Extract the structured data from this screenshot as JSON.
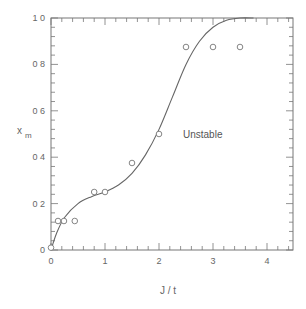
{
  "chart_data": {
    "type": "scatter",
    "title": "",
    "xlabel": "J / t",
    "ylabel": "x_m",
    "ylabel_main": "x",
    "ylabel_sub": "m",
    "xlim": [
      0,
      4.5
    ],
    "ylim": [
      0,
      1.0
    ],
    "x_ticks": [
      0,
      1,
      2,
      3,
      4
    ],
    "x_tick_labels": [
      "0",
      "1",
      "2",
      "3",
      "4"
    ],
    "y_ticks": [
      0,
      0.2,
      0.4,
      0.6,
      0.8,
      1.0
    ],
    "y_tick_labels": [
      "0",
      "0 2",
      "0 4",
      "0 6",
      "0 8",
      "1 0"
    ],
    "grid": false,
    "legend": null,
    "annotations": [
      {
        "text": "Unstable",
        "x": 2.6,
        "y": 0.49
      }
    ],
    "series": [
      {
        "name": "data points",
        "marker": "open-circle",
        "x": [
          0.0,
          0.13,
          0.24,
          0.44,
          0.8,
          1.0,
          1.5,
          2.0,
          2.5,
          3.0,
          3.5
        ],
        "y": [
          0.01,
          0.125,
          0.125,
          0.125,
          0.25,
          0.25,
          0.375,
          0.5,
          0.875,
          0.875,
          0.875
        ]
      },
      {
        "name": "fit curve",
        "marker": "line",
        "x": [
          0.0,
          0.1,
          0.25,
          0.5,
          0.75,
          1.0,
          1.25,
          1.5,
          1.75,
          2.0,
          2.25,
          2.5,
          2.75,
          3.0,
          3.25,
          3.5,
          3.75
        ],
        "y": [
          0.0,
          0.07,
          0.14,
          0.2,
          0.23,
          0.25,
          0.28,
          0.33,
          0.41,
          0.52,
          0.66,
          0.8,
          0.9,
          0.96,
          0.99,
          1.0,
          1.0
        ]
      }
    ]
  }
}
